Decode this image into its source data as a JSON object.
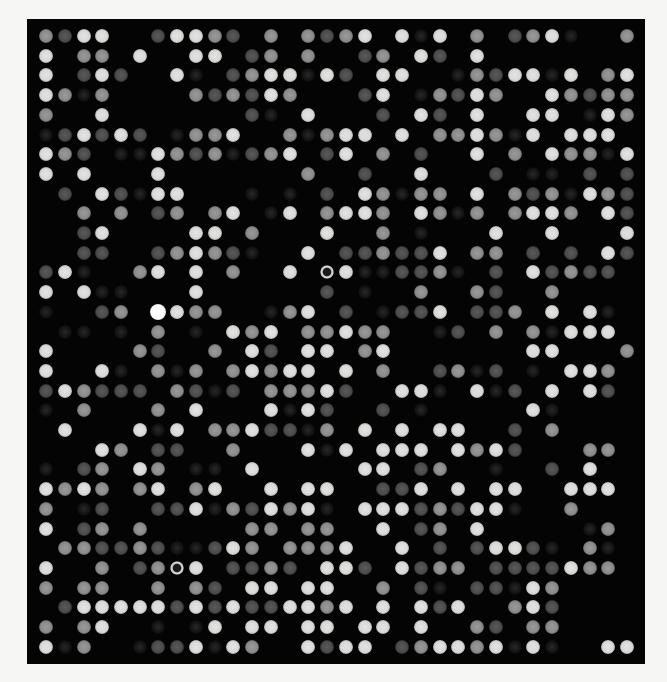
{
  "image": {
    "description": "microarray scan",
    "background_color": "#f6f6f4",
    "panel_color": "#040404",
    "grid": {
      "rows": 32,
      "cols": 32,
      "origin_x": 46,
      "origin_y": 36,
      "pitch_x": 18.74,
      "pitch_y": 19.7,
      "spot_diameter": 14
    },
    "intensity_legend": {
      "0": "none",
      "1": "faint",
      "2": "dim",
      "3": "medium",
      "4": "bright",
      "5": "saturated",
      "r": "ring"
    },
    "spots": [
      "3244002443203032340414030234100 3",
      "40330400440230300230420400000000",
      "40242004102344142044001324414034",
      "43130000323243000240132430043233",
      "30040000000210400020420400441043",
      "12424201330400313440433431404440",
      "43201143231234024030200403043314",
      "40400040000000300200400021102020",
      "02042144000101020431330403231432",
      "00303023034014034430431303443042",
      "00240000440300040030100040040004",
      "00220023432100402232240330202042",
      "2410034040300 40r41122310204232 20",
      "40411000400000020100300320030000",
      "10023054330013402012240223040410",
      "01101030104340334330012030314440",
      "40000320030420440340000000440003",
      "40041031303434404003002312010443 0",
      "24322203212033342004410412040420",
      "10300030400041420020100000410000",
      "04000414033422130404044002030000",
      "00043022003000414044404342000330",
      "10230430110400000440230010020400",
      "43430340340040440022404044004440",
      "30120022413243410444232441003000",
      "40230300000330330040230400000130",
      "03322321124303334004020244210310",
      "40030023r40223204420423302222430",
      "30330030320440440030210221430000",
      "02444442424224434040424003420000",
      "30340010104044044044004320330000",
      "41300122414300424402344341410044"
    ],
    "spot_rows": [
      [
        "3",
        "2",
        "4",
        "4",
        "0",
        "0",
        "2",
        "4",
        "4",
        "3",
        "2",
        "0",
        "3",
        "0",
        "3",
        "2",
        "3",
        "4",
        "0",
        "4",
        "1",
        "4",
        "0",
        "3",
        "0",
        "2",
        "3",
        "4",
        "1",
        "0",
        "0",
        "3"
      ],
      [
        "4",
        "0",
        "3",
        "3",
        "0",
        "4",
        "0",
        "0",
        "4",
        "4",
        "0",
        "2",
        "3",
        "0",
        "3",
        "0",
        "0",
        "2",
        "3",
        "0",
        "4",
        "2",
        "0",
        "4",
        "0",
        "0",
        "0",
        "0",
        "0",
        "0",
        "0",
        "0"
      ],
      [
        "4",
        "0",
        "2",
        "4",
        "2",
        "0",
        "0",
        "4",
        "1",
        "0",
        "2",
        "3",
        "4",
        "4",
        "1",
        "4",
        "2",
        "0",
        "4",
        "4",
        "0",
        "0",
        "1",
        "3",
        "2",
        "4",
        "4",
        "1",
        "4",
        "0",
        "3",
        "4"
      ],
      [
        "4",
        "3",
        "1",
        "3",
        "0",
        "0",
        "0",
        "0",
        "3",
        "2",
        "3",
        "2",
        "4",
        "3",
        "0",
        "0",
        "0",
        "2",
        "4",
        "0",
        "1",
        "3",
        "2",
        "4",
        "3",
        "0",
        "0",
        "4",
        "3",
        "2",
        "3",
        "3"
      ],
      [
        "3",
        "0",
        "0",
        "4",
        "0",
        "0",
        "0",
        "0",
        "0",
        "0",
        "0",
        "2",
        "1",
        "0",
        "4",
        "0",
        "0",
        "0",
        "2",
        "0",
        "4",
        "2",
        "0",
        "4",
        "0",
        "0",
        "4",
        "4",
        "0",
        "1",
        "4",
        "3"
      ],
      [
        "1",
        "2",
        "4",
        "2",
        "4",
        "2",
        "0",
        "1",
        "3",
        "3",
        "4",
        "0",
        "0",
        "3",
        "1",
        "3",
        "4",
        "4",
        "0",
        "4",
        "0",
        "3",
        "3",
        "4",
        "3",
        "1",
        "4",
        "0",
        "4",
        "4",
        "4",
        "0"
      ],
      [
        "4",
        "3",
        "2",
        "0",
        "1",
        "1",
        "4",
        "3",
        "2",
        "3",
        "1",
        "2",
        "3",
        "4",
        "0",
        "2",
        "4",
        "0",
        "3",
        "0",
        "2",
        "0",
        "0",
        "4",
        "0",
        "3",
        "0",
        "4",
        "3",
        "3",
        "1",
        "4"
      ],
      [
        "4",
        "0",
        "4",
        "0",
        "0",
        "0",
        "4",
        "0",
        "0",
        "0",
        "0",
        "0",
        "0",
        "0",
        "3",
        "0",
        "0",
        "2",
        "0",
        "0",
        "4",
        "0",
        "0",
        "0",
        "2",
        "0",
        "1",
        "1",
        "0",
        "2",
        "0",
        "2"
      ],
      [
        "0",
        "2",
        "0",
        "4",
        "2",
        "1",
        "4",
        "4",
        "0",
        "0",
        "0",
        "1",
        "0",
        "1",
        "0",
        "2",
        "0",
        "4",
        "3",
        "1",
        "3",
        "3",
        "0",
        "4",
        "0",
        "3",
        "2",
        "3",
        "1",
        "4",
        "3",
        "2"
      ],
      [
        "0",
        "0",
        "3",
        "0",
        "3",
        "0",
        "2",
        "3",
        "0",
        "3",
        "4",
        "0",
        "1",
        "4",
        "0",
        "3",
        "4",
        "4",
        "3",
        "0",
        "4",
        "3",
        "1",
        "3",
        "0",
        "3",
        "4",
        "4",
        "3",
        "0",
        "4",
        "2"
      ],
      [
        "0",
        "0",
        "2",
        "4",
        "0",
        "0",
        "0",
        "0",
        "4",
        "4",
        "0",
        "3",
        "0",
        "0",
        "0",
        "4",
        "0",
        "0",
        "3",
        "0",
        "1",
        "0",
        "0",
        "0",
        "4",
        "0",
        "0",
        "4",
        "0",
        "0",
        "0",
        "4"
      ],
      [
        "0",
        "0",
        "2",
        "2",
        "0",
        "0",
        "2",
        "3",
        "4",
        "3",
        "2",
        "1",
        "0",
        "0",
        "4",
        "0",
        "2",
        "2",
        "3",
        "2",
        "2",
        "4",
        "0",
        "3",
        "3",
        "0",
        "2",
        "0",
        "2",
        "0",
        "4",
        "2"
      ],
      [
        "2",
        "4",
        "1",
        "0",
        "0",
        "3",
        "4",
        "0",
        "4",
        "0",
        "3",
        "0",
        "0",
        "4",
        "0",
        "r",
        "4",
        "1",
        "1",
        "2",
        "2",
        "3",
        "1",
        "0",
        "2",
        "0",
        "4",
        "2",
        "3",
        "2",
        "2",
        "0"
      ],
      [
        "4",
        "0",
        "4",
        "1",
        "1",
        "0",
        "0",
        "0",
        "4",
        "0",
        "0",
        "0",
        "0",
        "0",
        "0",
        "2",
        "0",
        "1",
        "0",
        "0",
        "3",
        "0",
        "0",
        "3",
        "2",
        "0",
        "0",
        "3",
        "0",
        "0",
        "0",
        "0"
      ],
      [
        "1",
        "0",
        "0",
        "2",
        "3",
        "0",
        "5",
        "4",
        "3",
        "3",
        "0",
        "0",
        "1",
        "3",
        "4",
        "0",
        "2",
        "0",
        "1",
        "2",
        "2",
        "4",
        "0",
        "2",
        "2",
        "3",
        "0",
        "4",
        "0",
        "4",
        "1",
        "0"
      ],
      [
        "0",
        "1",
        "1",
        "0",
        "1",
        "0",
        "3",
        "0",
        "1",
        "0",
        "4",
        "3",
        "4",
        "0",
        "3",
        "3",
        "4",
        "3",
        "3",
        "0",
        "0",
        "1",
        "2",
        "0",
        "3",
        "0",
        "3",
        "1",
        "4",
        "4",
        "4",
        "0"
      ],
      [
        "4",
        "0",
        "0",
        "0",
        "0",
        "3",
        "2",
        "0",
        "0",
        "3",
        "0",
        "4",
        "2",
        "0",
        "4",
        "4",
        "0",
        "3",
        "4",
        "0",
        "0",
        "0",
        "0",
        "0",
        "0",
        "0",
        "4",
        "4",
        "0",
        "0",
        "0",
        "3"
      ],
      [
        "4",
        "0",
        "0",
        "4",
        "1",
        "0",
        "3",
        "1",
        "3",
        "0",
        "3",
        "4",
        "3",
        "4",
        "4",
        "0",
        "4",
        "0",
        "3",
        "0",
        "0",
        "2",
        "3",
        "1",
        "2",
        "0",
        "1",
        "0",
        "4",
        "4",
        "3",
        "0"
      ],
      [
        "2",
        "4",
        "3",
        "2",
        "2",
        "2",
        "0",
        "3",
        "2",
        "1",
        "2",
        "0",
        "3",
        "3",
        "3",
        "4",
        "2",
        "0",
        "0",
        "4",
        "4",
        "1",
        "0",
        "4",
        "1",
        "2",
        "0",
        "4",
        "0",
        "4",
        "2",
        "0"
      ],
      [
        "1",
        "0",
        "3",
        "0",
        "0",
        "0",
        "3",
        "0",
        "4",
        "0",
        "0",
        "0",
        "4",
        "1",
        "4",
        "2",
        "0",
        "0",
        "2",
        "0",
        "1",
        "0",
        "0",
        "0",
        "0",
        "0",
        "4",
        "1",
        "0",
        "0",
        "0",
        "0"
      ],
      [
        "0",
        "4",
        "0",
        "0",
        "0",
        "4",
        "1",
        "4",
        "0",
        "3",
        "3",
        "4",
        "2",
        "2",
        "1",
        "3",
        "0",
        "4",
        "0",
        "4",
        "0",
        "4",
        "4",
        "0",
        "0",
        "2",
        "0",
        "3",
        "0",
        "0",
        "0",
        "0"
      ],
      [
        "0",
        "0",
        "0",
        "4",
        "3",
        "0",
        "2",
        "2",
        "0",
        "0",
        "3",
        "0",
        "0",
        "0",
        "4",
        "1",
        "4",
        "0",
        "4",
        "4",
        "4",
        "0",
        "4",
        "3",
        "4",
        "2",
        "0",
        "0",
        "0",
        "3",
        "3",
        "0"
      ],
      [
        "1",
        "0",
        "2",
        "3",
        "0",
        "4",
        "3",
        "0",
        "1",
        "1",
        "0",
        "4",
        "0",
        "0",
        "0",
        "0",
        "0",
        "4",
        "4",
        "0",
        "2",
        "3",
        "0",
        "0",
        "1",
        "0",
        "0",
        "2",
        "0",
        "4",
        "0",
        "0"
      ],
      [
        "4",
        "3",
        "4",
        "3",
        "0",
        "3",
        "4",
        "0",
        "3",
        "4",
        "0",
        "0",
        "4",
        "0",
        "4",
        "4",
        "0",
        "0",
        "2",
        "2",
        "4",
        "0",
        "4",
        "0",
        "4",
        "4",
        "0",
        "0",
        "4",
        "4",
        "4",
        "0"
      ],
      [
        "3",
        "0",
        "1",
        "2",
        "0",
        "0",
        "2",
        "2",
        "4",
        "1",
        "3",
        "2",
        "4",
        "3",
        "4",
        "1",
        "0",
        "4",
        "4",
        "4",
        "2",
        "3",
        "2",
        "4",
        "4",
        "1",
        "0",
        "0",
        "3",
        "0",
        "0",
        "0"
      ],
      [
        "4",
        "0",
        "2",
        "3",
        "0",
        "3",
        "0",
        "0",
        "0",
        "0",
        "0",
        "3",
        "3",
        "0",
        "3",
        "3",
        "0",
        "0",
        "4",
        "0",
        "2",
        "3",
        "0",
        "4",
        "0",
        "0",
        "0",
        "0",
        "0",
        "1",
        "3",
        "0"
      ],
      [
        "0",
        "3",
        "3",
        "2",
        "2",
        "3",
        "2",
        "1",
        "1",
        "2",
        "4",
        "3",
        "0",
        "3",
        "3",
        "3",
        "4",
        "0",
        "0",
        "4",
        "0",
        "2",
        "0",
        "2",
        "4",
        "4",
        "2",
        "1",
        "0",
        "3",
        "1",
        "0"
      ],
      [
        "4",
        "0",
        "0",
        "3",
        "0",
        "2",
        "3",
        "r",
        "4",
        "0",
        "2",
        "2",
        "3",
        "2",
        "0",
        "4",
        "4",
        "2",
        "0",
        "4",
        "2",
        "3",
        "3",
        "0",
        "2",
        "2",
        "2",
        "2",
        "4",
        "3",
        "3",
        "0"
      ],
      [
        "3",
        "0",
        "3",
        "3",
        "0",
        "0",
        "3",
        "0",
        "3",
        "2",
        "0",
        "4",
        "4",
        "0",
        "4",
        "4",
        "0",
        "0",
        "3",
        "0",
        "2",
        "1",
        "0",
        "2",
        "2",
        "1",
        "4",
        "3",
        "0",
        "0",
        "0",
        "0"
      ],
      [
        "0",
        "2",
        "4",
        "4",
        "4",
        "4",
        "4",
        "2",
        "4",
        "2",
        "4",
        "2",
        "2",
        "4",
        "4",
        "3",
        "4",
        "0",
        "4",
        "0",
        "4",
        "2",
        "4",
        "0",
        "0",
        "3",
        "4",
        "2",
        "0",
        "0",
        "0",
        "0"
      ],
      [
        "3",
        "0",
        "3",
        "4",
        "0",
        "0",
        "1",
        "0",
        "1",
        "4",
        "0",
        "4",
        "4",
        "0",
        "4",
        "4",
        "0",
        "4",
        "4",
        "0",
        "4",
        "0",
        "0",
        "3",
        "2",
        "0",
        "3",
        "3",
        "0",
        "0",
        "0",
        "0"
      ],
      [
        "4",
        "1",
        "3",
        "0",
        "0",
        "1",
        "2",
        "2",
        "4",
        "1",
        "4",
        "3",
        "0",
        "0",
        "4",
        "2",
        "4",
        "4",
        "0",
        "2",
        "3",
        "4",
        "4",
        "3",
        "4",
        "1",
        "4",
        "1",
        "0",
        "0",
        "4",
        "4"
      ]
    ]
  }
}
